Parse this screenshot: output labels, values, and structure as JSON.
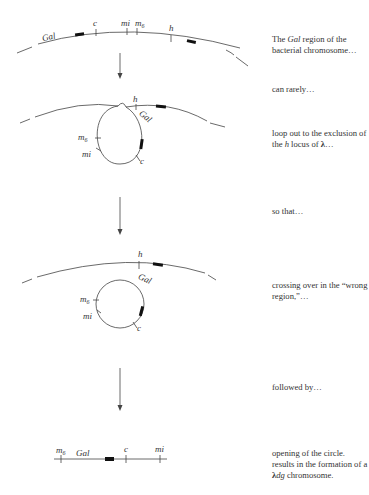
{
  "diagram": {
    "stage1": {
      "labels": {
        "gal": "Gal",
        "c": "c",
        "mi": "mi",
        "m6": "m",
        "m6_sub": "6",
        "h": "h"
      }
    },
    "stage2": {
      "labels": {
        "gal": "Gal",
        "c": "c",
        "mi": "mi",
        "m6": "m",
        "m6_sub": "6",
        "h": "h"
      }
    },
    "stage3": {
      "labels": {
        "gal": "Gal",
        "c": "c",
        "mi": "mi",
        "m6": "m",
        "m6_sub": "6",
        "h": "h"
      }
    },
    "stage4": {
      "labels": {
        "gal": "Gal",
        "c": "c",
        "mi": "mi",
        "m6": "m",
        "m6_sub": "6"
      }
    }
  },
  "captions": [
    {
      "id": "caption-1",
      "pre": "The ",
      "italic": "Gal",
      "post": " region of the bacterial chromosome…"
    },
    {
      "id": "caption-2",
      "text": "can rarely…"
    },
    {
      "id": "caption-3",
      "pre": "loop out to the exclusion of the ",
      "italic": "h",
      "mid": " locus of ",
      "bold": "λ",
      "post": "…"
    },
    {
      "id": "caption-4",
      "text": "so that…"
    },
    {
      "id": "caption-5",
      "text": "crossing over in the “wrong region,”…"
    },
    {
      "id": "caption-6",
      "text": "followed by…"
    },
    {
      "id": "caption-7",
      "pre": "opening of the circle. results in the formation of a ",
      "bold": "λ",
      "italic": "dg",
      "post": " chromosome."
    }
  ],
  "colors": {
    "line": "#444444",
    "block": "#111111",
    "text": "#333333"
  }
}
